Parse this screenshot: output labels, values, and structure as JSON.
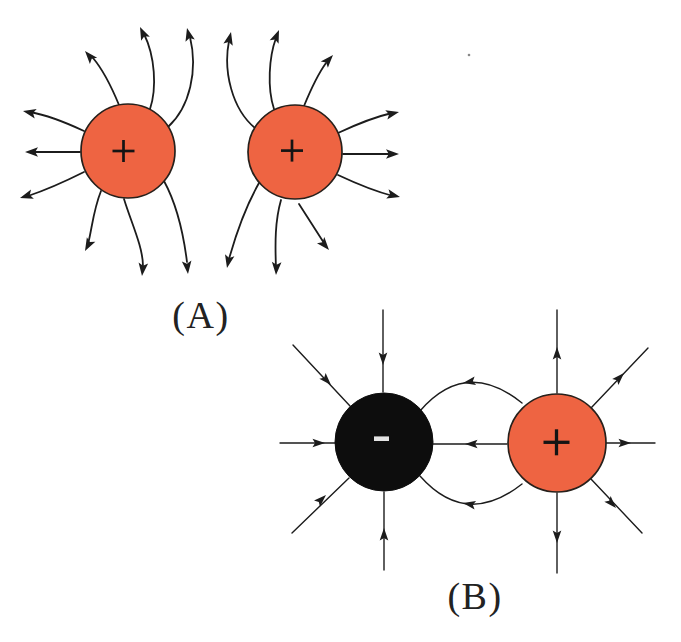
{
  "figure": {
    "background": "#ffffff",
    "line_color": "#1c1c1c",
    "stray_mark": {
      "x": 469,
      "y": 55,
      "r": 1.3,
      "color": "#6a6a6a"
    },
    "panels": [
      {
        "name": "A",
        "label": "(A)",
        "label_x": 201,
        "label_y": 328,
        "description": "two positive charges, field lines repelling",
        "stroke_width": 1.8,
        "arrow": {
          "length": 13,
          "half_width": 4.8,
          "back": 10.2
        },
        "charges": [
          {
            "type": "positive",
            "symbol": "+",
            "cx": 128,
            "cy": 151,
            "r": 47,
            "fill": "#ee6442",
            "stroke": "#27201b",
            "stroke_width": 1.7,
            "symbol_color": "#141414",
            "symbol_half": 11,
            "symbol_stroke": 2.7,
            "symbol_dx": -4.5,
            "symbol_dy": 0
          },
          {
            "type": "positive",
            "symbol": "+",
            "cx": 295,
            "cy": 152,
            "r": 47,
            "fill": "#ee6442",
            "stroke": "#27201b",
            "stroke_width": 1.7,
            "symbol_color": "#141414",
            "symbol_half": 11,
            "symbol_stroke": 2.7,
            "symbol_dx": -3,
            "symbol_dy": -1.4
          }
        ],
        "field_lines": [
          {
            "d": "M 80 152 L 30 152",
            "arrows": [
              {
                "x": 25,
                "y": 152,
                "angle": 180
              }
            ]
          },
          {
            "d": "M 84 131 Q 52 116 30 112",
            "arrows": [
              {
                "x": 23,
                "y": 111,
                "angle": 192
              }
            ]
          },
          {
            "d": "M 84 172 Q 52 188 28 196",
            "arrows": [
              {
                "x": 20,
                "y": 198,
                "angle": 163
              }
            ]
          },
          {
            "d": "M 119 105 C 112 88 104 71 93 58",
            "arrows": [
              {
                "x": 85,
                "y": 51,
                "angle": 229
              }
            ]
          },
          {
            "d": "M 150 109 C 157 88 155 56 144 34",
            "arrows": [
              {
                "x": 140,
                "y": 27,
                "angle": 245
              }
            ]
          },
          {
            "d": "M 168 127 C 190 107 198 70 190 37",
            "arrows": [
              {
                "x": 187,
                "y": 28,
                "angle": 256
              }
            ]
          },
          {
            "d": "M 101 191 C 93 211 92 229 88 244",
            "arrows": [
              {
                "x": 85,
                "y": 251,
                "angle": 118
              }
            ]
          },
          {
            "d": "M 124 199 C 131 222 143 247 143 266",
            "arrows": [
              {
                "x": 142,
                "y": 276,
                "angle": 96
              }
            ]
          },
          {
            "d": "M 164 181 C 176 203 183 230 187 262",
            "arrows": [
              {
                "x": 188,
                "y": 274,
                "angle": 84
              }
            ]
          },
          {
            "d": "M 343 154 L 394 154",
            "arrows": [
              {
                "x": 399,
                "y": 154,
                "angle": 0
              }
            ]
          },
          {
            "d": "M 338 133 Q 370 118 392 113",
            "arrows": [
              {
                "x": 399,
                "y": 112,
                "angle": 347
              }
            ]
          },
          {
            "d": "M 338 175 Q 370 190 393 196",
            "arrows": [
              {
                "x": 400,
                "y": 197,
                "angle": 14
              }
            ]
          },
          {
            "d": "M 304 106 C 311 89 318 74 326 63",
            "arrows": [
              {
                "x": 333,
                "y": 55,
                "angle": 312
              }
            ]
          },
          {
            "d": "M 274 109 C 267 88 269 57 276 38",
            "arrows": [
              {
                "x": 279,
                "y": 30,
                "angle": 292
              }
            ]
          },
          {
            "d": "M 255 128 C 232 109 223 71 229 41",
            "arrows": [
              {
                "x": 231,
                "y": 32,
                "angle": 283
              }
            ]
          },
          {
            "d": "M 299 204 C 308 218 317 232 324 243",
            "arrows": [
              {
                "x": 329,
                "y": 250,
                "angle": 50
              }
            ]
          },
          {
            "d": "M 281 200 C 275 221 275 243 276 268",
            "arrows": [
              {
                "x": 276,
                "y": 275,
                "angle": 93
              }
            ]
          },
          {
            "d": "M 259 183 C 246 206 236 234 229 259",
            "arrows": [
              {
                "x": 227,
                "y": 268,
                "angle": 102
              }
            ]
          }
        ]
      },
      {
        "name": "B",
        "label": "(B)",
        "label_x": 475,
        "label_y": 609,
        "description": "negative and positive charge, field lines attracting",
        "stroke_width": 1.4,
        "arrow": {
          "length": 12.5,
          "half_width": 4.3,
          "back": 10
        },
        "charges": [
          {
            "type": "negative",
            "symbol": "-",
            "cx": 384,
            "cy": 442,
            "r": 49,
            "fill": "#0d0d0d",
            "stroke": "#0d0d0d",
            "stroke_width": 1,
            "symbol_color": "#e3e3e3",
            "symbol_half": 7.5,
            "symbol_stroke": 4.6,
            "symbol_dx": -2.5,
            "symbol_dy": -3.3
          },
          {
            "type": "positive",
            "symbol": "+",
            "cx": 557,
            "cy": 443,
            "r": 49,
            "fill": "#ee6442",
            "stroke": "#27201b",
            "stroke_width": 1.7,
            "symbol_color": "#141414",
            "symbol_half": 13,
            "symbol_stroke": 3.3,
            "symbol_dx": -0.5,
            "symbol_dy": -0.7
          }
        ],
        "field_lines": [
          {
            "d": "M 383 310 L 383 392",
            "arrows": [
              {
                "x": 383,
                "y": 365,
                "angle": 90
              }
            ]
          },
          {
            "d": "M 384 570 L 384 492",
            "arrows": [
              {
                "x": 384,
                "y": 528,
                "angle": 270
              }
            ]
          },
          {
            "d": "M 280 443 L 336 443",
            "arrows": [
              {
                "x": 325,
                "y": 443,
                "angle": 0
              }
            ]
          },
          {
            "d": "M 293 345 L 350 406",
            "arrows": [
              {
                "x": 331,
                "y": 385,
                "angle": 47
              }
            ]
          },
          {
            "d": "M 292 533 L 349 478",
            "arrows": [
              {
                "x": 326,
                "y": 495,
                "angle": 316
              }
            ]
          },
          {
            "d": "M 557 393 L 557 310",
            "arrows": [
              {
                "x": 557,
                "y": 347,
                "angle": 270
              }
            ]
          },
          {
            "d": "M 557 493 L 557 573",
            "arrows": [
              {
                "x": 557,
                "y": 543,
                "angle": 90
              }
            ]
          },
          {
            "d": "M 606 443 L 655 443",
            "arrows": [
              {
                "x": 631,
                "y": 443,
                "angle": 0
              }
            ]
          },
          {
            "d": "M 591 408 L 648 348",
            "arrows": [
              {
                "x": 624,
                "y": 373,
                "angle": 314
              }
            ]
          },
          {
            "d": "M 591 479 L 642 533",
            "arrows": [
              {
                "x": 616,
                "y": 508,
                "angle": 47
              }
            ]
          },
          {
            "d": "M 507 444 L 433 444",
            "arrows": [
              {
                "x": 465,
                "y": 444,
                "angle": 180
              }
            ]
          },
          {
            "d": "M 522 403 Q 466 358 420 411",
            "arrows": [
              {
                "x": 463,
                "y": 383,
                "angle": 170
              }
            ]
          },
          {
            "d": "M 522 484 Q 466 528 420 476",
            "arrows": [
              {
                "x": 463,
                "y": 503,
                "angle": 190
              }
            ]
          }
        ]
      }
    ]
  }
}
